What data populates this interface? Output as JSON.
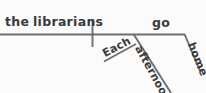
{
  "diagram": {
    "type": "sentence-diagram",
    "style": "Reed-Kellogg",
    "sentence": "Each afternoon the librarians go home.",
    "ink_color": "#6e6e6e",
    "text_color": "#3a3a3a",
    "background_color": "#fbfbfb",
    "baseline": {
      "label": "main-baseline",
      "x1": 0,
      "y1": 34,
      "x2": 185,
      "y2": 34
    },
    "divider": {
      "label": "subject-predicate-divider",
      "x": 92,
      "y1": 19,
      "y2": 47
    },
    "words": {
      "determiner": "the",
      "subject": "librarians",
      "verb": "go",
      "adverb_modifier": "Each",
      "adverb": "afternoon",
      "adverb_of_place": "home"
    },
    "lines": [
      {
        "name": "afternoon-modifier-line",
        "x1": 134,
        "y1": 34,
        "x2": 171,
        "y2": 93
      },
      {
        "name": "each-modifier-line",
        "x1": 104,
        "y1": 61,
        "x2": 135,
        "y2": 44
      },
      {
        "name": "home-modifier-line",
        "x1": 185,
        "y1": 34,
        "x2": 200,
        "y2": 71
      }
    ]
  }
}
